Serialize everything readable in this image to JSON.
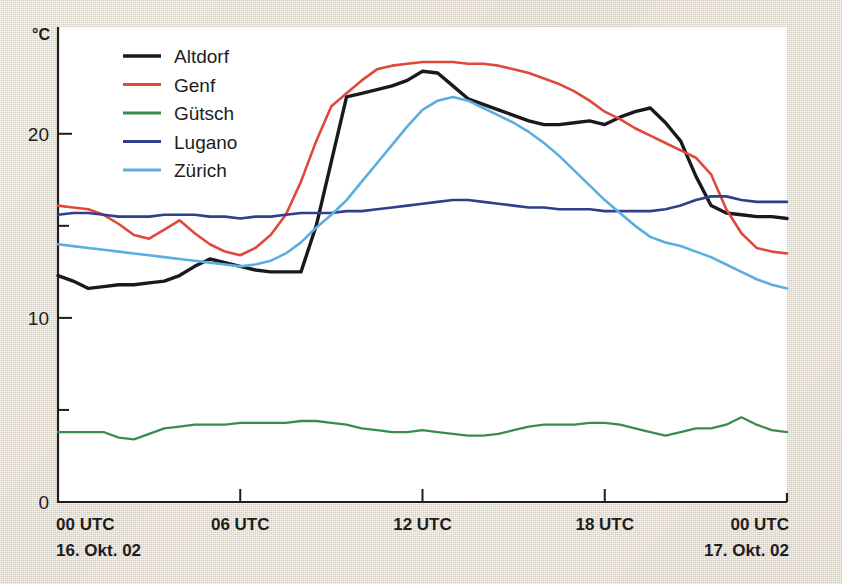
{
  "chart_data": {
    "type": "line",
    "title": "",
    "subtitle": "",
    "xlabel": "",
    "ylabel": "°C",
    "unit": "°C",
    "xlim": [
      0,
      24
    ],
    "ylim": [
      0,
      25.8
    ],
    "grid": false,
    "legend_position": "top-left",
    "y_ticks_major": [
      0,
      10,
      20
    ],
    "y_ticks_major_labels": [
      "0",
      "10",
      "20"
    ],
    "y_ticks_minor": [
      5,
      15
    ],
    "x_ticks": [
      0,
      6,
      12,
      18,
      24
    ],
    "x_tick_labels": [
      "00 UTC",
      "06 UTC",
      "12 UTC",
      "18 UTC",
      "00 UTC"
    ],
    "x_date_left": "16. Okt. 02",
    "x_date_right": "17. Okt. 02",
    "x_hours": [
      0,
      0.5,
      1,
      1.5,
      2,
      2.5,
      3,
      3.5,
      4,
      4.5,
      5,
      5.5,
      6,
      6.5,
      7,
      7.5,
      8,
      8.5,
      9,
      9.5,
      10,
      10.5,
      11,
      11.5,
      12,
      12.5,
      13,
      13.5,
      14,
      14.5,
      15,
      15.5,
      16,
      16.5,
      17,
      17.5,
      18,
      18.5,
      19,
      19.5,
      20,
      20.5,
      21,
      21.5,
      22,
      22.5,
      23,
      23.5,
      24
    ],
    "series": [
      {
        "name": "Altdorf",
        "color": "#1a1a1a",
        "width": 3.4,
        "values": [
          12.3,
          12.0,
          11.6,
          11.7,
          11.8,
          11.8,
          11.9,
          12.0,
          12.3,
          12.8,
          13.2,
          13.0,
          12.8,
          12.6,
          12.5,
          12.5,
          12.5,
          15.0,
          18.5,
          22.0,
          22.2,
          22.4,
          22.6,
          22.9,
          23.4,
          23.3,
          22.6,
          21.9,
          21.6,
          21.3,
          21.0,
          20.7,
          20.5,
          20.5,
          20.6,
          20.7,
          20.5,
          20.9,
          21.2,
          21.4,
          20.6,
          19.6,
          17.7,
          16.1,
          15.7,
          15.6,
          15.5,
          15.5,
          15.4
        ]
      },
      {
        "name": "Genf",
        "color": "#e0483a",
        "width": 2.6,
        "values": [
          16.1,
          16.0,
          15.9,
          15.6,
          15.1,
          14.5,
          14.3,
          14.8,
          15.3,
          14.6,
          14.0,
          13.6,
          13.4,
          13.8,
          14.5,
          15.6,
          17.4,
          19.6,
          21.5,
          22.2,
          22.9,
          23.5,
          23.7,
          23.8,
          23.9,
          23.9,
          23.9,
          23.8,
          23.8,
          23.7,
          23.5,
          23.3,
          23.0,
          22.7,
          22.3,
          21.8,
          21.2,
          20.8,
          20.3,
          19.9,
          19.5,
          19.1,
          18.7,
          17.8,
          15.9,
          14.6,
          13.8,
          13.6,
          13.5
        ]
      },
      {
        "name": "Gütsch",
        "color": "#3a8c4e",
        "width": 2.3,
        "values": [
          3.8,
          3.8,
          3.8,
          3.8,
          3.5,
          3.4,
          3.7,
          4.0,
          4.1,
          4.2,
          4.2,
          4.2,
          4.3,
          4.3,
          4.3,
          4.3,
          4.4,
          4.4,
          4.3,
          4.2,
          4.0,
          3.9,
          3.8,
          3.8,
          3.9,
          3.8,
          3.7,
          3.6,
          3.6,
          3.7,
          3.9,
          4.1,
          4.2,
          4.2,
          4.2,
          4.3,
          4.3,
          4.2,
          4.0,
          3.8,
          3.6,
          3.8,
          4.0,
          4.0,
          4.2,
          4.6,
          4.2,
          3.9,
          3.8
        ]
      },
      {
        "name": "Lugano",
        "color": "#2f3f8c",
        "width": 2.6,
        "values": [
          15.6,
          15.7,
          15.7,
          15.6,
          15.5,
          15.5,
          15.5,
          15.6,
          15.6,
          15.6,
          15.5,
          15.5,
          15.4,
          15.5,
          15.5,
          15.6,
          15.7,
          15.7,
          15.7,
          15.8,
          15.8,
          15.9,
          16.0,
          16.1,
          16.2,
          16.3,
          16.4,
          16.4,
          16.3,
          16.2,
          16.1,
          16.0,
          16.0,
          15.9,
          15.9,
          15.9,
          15.8,
          15.8,
          15.8,
          15.8,
          15.9,
          16.1,
          16.4,
          16.6,
          16.6,
          16.4,
          16.3,
          16.3,
          16.3
        ]
      },
      {
        "name": "Zürich",
        "color": "#5aaee2",
        "width": 2.6,
        "values": [
          14.0,
          13.9,
          13.8,
          13.7,
          13.6,
          13.5,
          13.4,
          13.3,
          13.2,
          13.1,
          13.0,
          12.9,
          12.8,
          12.9,
          13.1,
          13.5,
          14.1,
          14.9,
          15.6,
          16.4,
          17.4,
          18.4,
          19.4,
          20.4,
          21.3,
          21.8,
          22.0,
          21.8,
          21.4,
          21.0,
          20.6,
          20.1,
          19.5,
          18.8,
          18.0,
          17.2,
          16.4,
          15.7,
          15.0,
          14.4,
          14.1,
          13.9,
          13.6,
          13.3,
          12.9,
          12.5,
          12.1,
          11.8,
          11.6
        ]
      }
    ]
  },
  "legend": {
    "items": [
      {
        "label": "Altdorf",
        "color": "#1a1a1a"
      },
      {
        "label": "Genf",
        "color": "#e0483a"
      },
      {
        "label": "Gütsch",
        "color": "#3a8c4e"
      },
      {
        "label": "Lugano",
        "color": "#2f3f8c"
      },
      {
        "label": "Zürich",
        "color": "#5aaee2"
      }
    ]
  },
  "axes": {
    "y_unit": "°C",
    "y_labels": [
      "20",
      "10",
      "0"
    ],
    "x_labels": [
      "00 UTC",
      "06 UTC",
      "12 UTC",
      "18 UTC",
      "00 UTC"
    ],
    "date_left": "16. Okt. 02",
    "date_right": "17. Okt. 02"
  }
}
